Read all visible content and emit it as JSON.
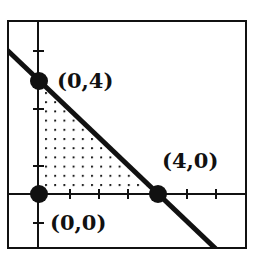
{
  "figure": {
    "frame": true,
    "axes": {
      "x_ticks": 5,
      "y_ticks": 4
    },
    "boundary_line": "x + y = 4",
    "shading": "dotted"
  },
  "vertices": [
    {
      "label": "(0,4)",
      "x": 0,
      "y": 4
    },
    {
      "label": "(4,0)",
      "x": 4,
      "y": 0
    },
    {
      "label": "(0,0)",
      "x": 0,
      "y": 0
    }
  ],
  "colors": {
    "ink": "#111111",
    "background": "#ffffff"
  }
}
